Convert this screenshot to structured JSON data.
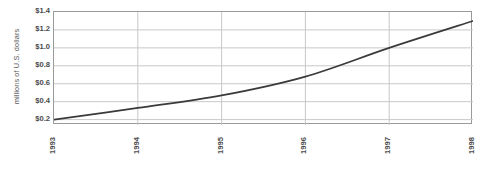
{
  "chart_data": {
    "type": "line",
    "title": "",
    "subtitle": "",
    "xlabel": "",
    "ylabel": "millions of U.S. dollars",
    "x": [
      1993,
      1994,
      1995,
      1996,
      1997,
      1998
    ],
    "categories": [
      "1993",
      "1994",
      "1995",
      "1996",
      "1997",
      "1998"
    ],
    "values": [
      0.2,
      0.33,
      0.47,
      0.68,
      1.0,
      1.3
    ],
    "series": [
      {
        "name": "",
        "values": [
          0.2,
          0.33,
          0.47,
          0.68,
          1.0,
          1.3
        ]
      }
    ],
    "xlim": [
      1993,
      1998
    ],
    "ylim": [
      0.14,
      1.4
    ],
    "ytick_values": [
      0.2,
      0.4,
      0.6,
      0.8,
      1.0,
      1.2,
      1.4
    ],
    "ytick_labels": [
      "$0.2",
      "$0.4",
      "$0.6",
      "$0.8",
      "$1.0",
      "$1.2",
      "$1.4"
    ],
    "xtick_labels": [
      "1993",
      "1994",
      "1995",
      "1996",
      "1997",
      "1998"
    ],
    "grid": true,
    "grid_axis": "both",
    "legend": false,
    "legend_position": "none",
    "line_color": "#3a3a3a",
    "grid_color": "#c8c8c8",
    "border_color": "#9a9a9c",
    "background_color": "#ffffff",
    "annotations": []
  },
  "axes": {
    "y_title": "millions of U.S. dollars",
    "y_ticks": [
      {
        "label": "$1.4",
        "value": 1.4
      },
      {
        "label": "$1.2",
        "value": 1.2
      },
      {
        "label": "$1.0",
        "value": 1.0
      },
      {
        "label": "$0.8",
        "value": 0.8
      },
      {
        "label": "$0.6",
        "value": 0.6
      },
      {
        "label": "$0.4",
        "value": 0.4
      },
      {
        "label": "$0.2",
        "value": 0.2
      }
    ],
    "x_ticks": [
      {
        "label": "1993",
        "value": 1993
      },
      {
        "label": "1994",
        "value": 1994
      },
      {
        "label": "1995",
        "value": 1995
      },
      {
        "label": "1996",
        "value": 1996
      },
      {
        "label": "1997",
        "value": 1997
      },
      {
        "label": "1998",
        "value": 1998
      }
    ]
  }
}
